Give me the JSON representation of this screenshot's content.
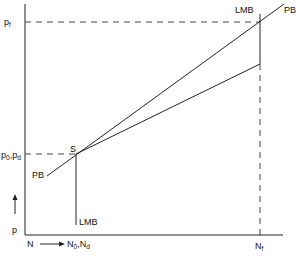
{
  "diagram": {
    "type": "line-diagram",
    "axes": {
      "y_label": "p",
      "x_origin_label": "N",
      "x_arrow_label": "N_0,N_d",
      "x_end_label": "N_f"
    },
    "y_ticks": [
      {
        "main": "p",
        "sub": "f",
        "label": "p_f"
      },
      {
        "main": "p",
        "sub": "0",
        "main2": "p",
        "sub2": "d",
        "label": "p_0,p_d"
      }
    ],
    "x_ticks": [
      {
        "main": "N",
        "sub": "0",
        "main2": "N",
        "sub2": "d",
        "label": "N_0,N_d"
      },
      {
        "main": "N",
        "sub": "f",
        "label": "N_f"
      }
    ],
    "curves": [
      {
        "name": "PB",
        "label": "PB",
        "description": "upward sloping line through S"
      },
      {
        "name": "LMB",
        "label": "LMB",
        "description": "vertical line at N_0 below S, and vertical at N_f"
      },
      {
        "name": "lower-line",
        "label": "",
        "description": "flatter line from S to LMB at N_f"
      }
    ],
    "points": [
      {
        "name": "S",
        "label": "S"
      }
    ],
    "labels": {
      "pf_main": "p",
      "pf_sub": "f",
      "p0_main": "p",
      "p0_sub": "0",
      "pd_main": "p",
      "pd_sub": "d",
      "comma": ",",
      "p_axis": "p",
      "n_origin": "N",
      "n0_main": "N",
      "n0_sub": "0",
      "nd_main": "N",
      "nd_sub": "d",
      "nf_main": "N",
      "nf_sub": "f",
      "s_point": "S",
      "pb_lower": "PB",
      "pb_upper": "PB",
      "lmb_lower": "LMB",
      "lmb_upper": "LMB"
    }
  }
}
